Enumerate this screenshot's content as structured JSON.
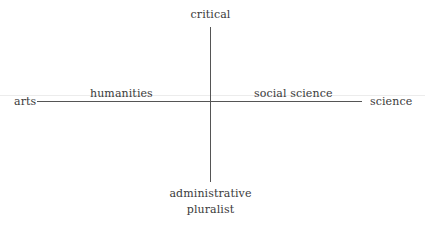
{
  "diagram": {
    "type": "two-axis quadrant diagram",
    "vertical_axis": {
      "top_label": "critical",
      "bottom_label_lines": [
        "administrative",
        "pluralist"
      ]
    },
    "horizontal_axis": {
      "left_label": "arts",
      "right_label": "science",
      "left_inner_label": "humanities",
      "right_inner_label": "social science"
    },
    "colors": {
      "line": "#555555",
      "text": "#3a3a3a",
      "background": "#ffffff"
    }
  }
}
